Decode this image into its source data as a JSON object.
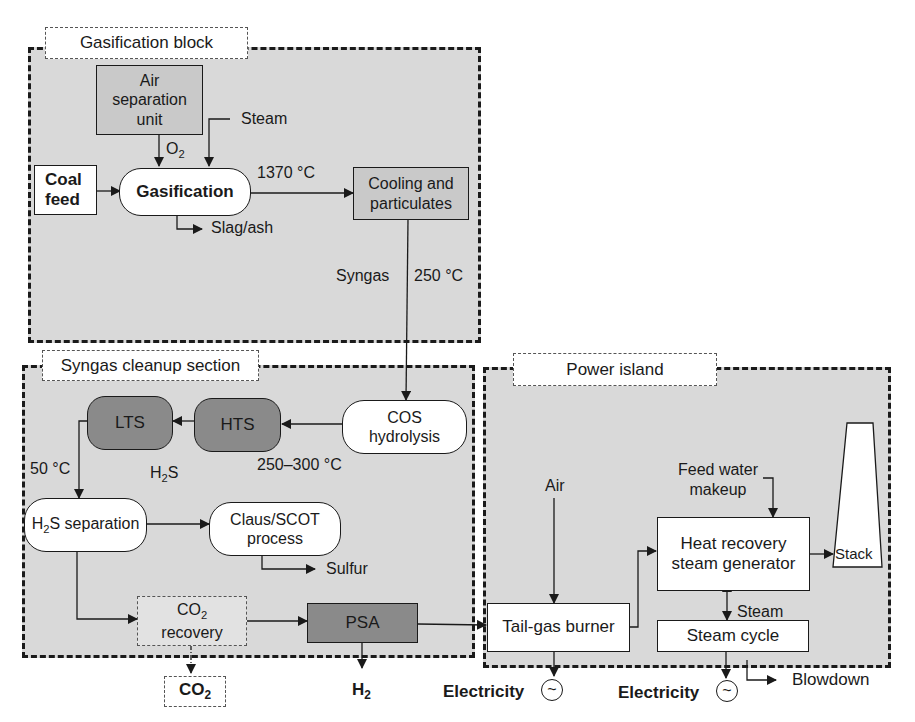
{
  "sections": {
    "gasification": {
      "label": "Gasification block"
    },
    "cleanup": {
      "label": "Syngas cleanup section"
    },
    "power": {
      "label": "Power island"
    }
  },
  "nodes": {
    "air_separation": "Air separation unit",
    "coal_feed": "Coal feed",
    "gasification": "Gasification",
    "cooling": "Cooling and particulates",
    "cos_hydrolysis": "COS hydrolysis",
    "hts": "HTS",
    "lts": "LTS",
    "h2s_separation_sub": "S separation",
    "claus_scot": "Claus/SCOT process",
    "co2_recovery_sub": "recovery",
    "psa": "PSA",
    "tail_gas_burner": "Tail-gas burner",
    "hrsg": "Heat recovery steam generator",
    "steam_cycle": "Steam cycle",
    "stack": "Stack"
  },
  "streams": {
    "steam_in": "Steam",
    "o2": "O",
    "o2_sub": "2",
    "temp_1370": "1370 °C",
    "slag_ash": "Slag/ash",
    "syngas": "Syngas",
    "temp_250": "250 °C",
    "temp_250_300": "250–300 °C",
    "temp_50": "50 °C",
    "h2s": "H",
    "h2s_sub": "2",
    "h2s_tail": "S",
    "sulfur": "Sulfur",
    "co2_out": "CO",
    "co2_sub": "2",
    "h2_out": "H",
    "h2_sub": "2",
    "air": "Air",
    "feed_water": "Feed water makeup",
    "steam_loop": "Steam",
    "electricity_1": "Electricity",
    "electricity_2": "Electricity",
    "blowdown": "Blowdown"
  },
  "icons": {
    "generator": "~"
  },
  "colors": {
    "section_fill": "#d9d9d9",
    "dark_unit": "#8a8a8a",
    "line": "#1a1a1a"
  }
}
